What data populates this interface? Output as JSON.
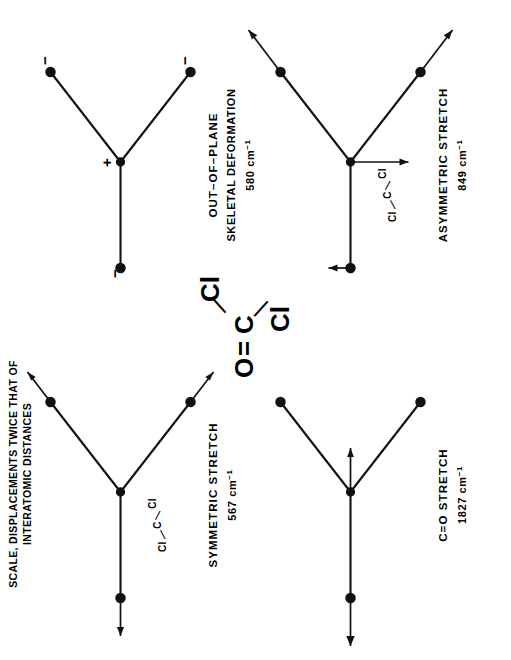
{
  "figure": {
    "header_note_line1": "SCALE, DISPLACEMENTS TWICE THAT OF",
    "header_note_line2": "INTERATOMIC DISTANCES",
    "molecule": {
      "name": "phosgene",
      "atom_o": "O",
      "bond_double": "=",
      "atom_c": "C",
      "bond_single_upper": "—",
      "atom_cl_upper": "Cl",
      "bond_single_lower": "—",
      "atom_cl_lower": "Cl"
    },
    "ink_color": "#111111",
    "background_color": "#ffffff"
  },
  "modes": [
    {
      "id": "symmetric-stretch",
      "caption_line1": "SYMMETRIC STRETCH",
      "caption_line2": "567 cm",
      "caption_line2_sup": "−1",
      "inset_cl_left": "Cl",
      "inset_c": "C",
      "inset_cl_right": "Cl",
      "inset_bond_left": "—",
      "inset_bond_right": "—",
      "has_inset": true,
      "wavenumber": 567,
      "units": "cm^-1",
      "arrows": [
        "O outward",
        "Cl upper outward",
        "Cl lower outward"
      ]
    },
    {
      "id": "out-of-plane-skeletal-deformation",
      "caption_line1": "OUT–OF–PLANE",
      "caption_line2": "SKELETAL DEFORMATION",
      "caption_line3": "580 cm",
      "caption_line3_sup": "−1",
      "has_inset": false,
      "wavenumber": 580,
      "units": "cm^-1",
      "sign_center": "+",
      "sign_o": "−",
      "sign_cl_upper": "−",
      "sign_cl_lower": "−"
    },
    {
      "id": "c-o-stretch",
      "caption_line1": "C=O STRETCH",
      "caption_line2": "1827 cm",
      "caption_line2_sup": "−1",
      "has_inset": false,
      "wavenumber": 1827,
      "units": "cm^-1",
      "arrows": [
        "O outward",
        "C inward toward Cl side"
      ]
    },
    {
      "id": "asymmetric-stretch",
      "caption_line1": "ASYMMETRIC STRETCH",
      "caption_line2": "849 cm",
      "caption_line2_sup": "−1",
      "inset_cl_left": "Cl",
      "inset_c": "C",
      "inset_cl_right": "Cl",
      "inset_bond_left": "—",
      "inset_bond_right": "—",
      "has_inset": true,
      "wavenumber": 849,
      "units": "cm^-1",
      "arrows": [
        "O small up",
        "C down",
        "Cl upper outward",
        "Cl lower outward"
      ]
    }
  ]
}
